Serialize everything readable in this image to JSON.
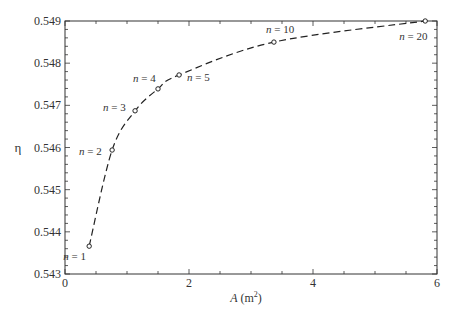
{
  "chart_data": {
    "type": "line",
    "title": "",
    "xlabel": "A (m²)",
    "xlabel_parts": {
      "var": "A",
      "unit_open": " (m",
      "sup": "2",
      "unit_close": ")"
    },
    "ylabel": "η",
    "xlim": [
      0,
      6
    ],
    "ylim": [
      0.543,
      0.549
    ],
    "xticks": [
      0,
      2,
      4,
      6
    ],
    "xtick_labels": [
      "0",
      "2",
      "4",
      "6"
    ],
    "x_minor_step": 0.5,
    "yticks": [
      0.543,
      0.544,
      0.545,
      0.546,
      0.547,
      0.548,
      0.549
    ],
    "ytick_labels": [
      "0.543",
      "0.544",
      "0.545",
      "0.546",
      "0.547",
      "0.548",
      "0.549"
    ],
    "y_minor_step": 0.0002,
    "grid": false,
    "line_style": "dashed",
    "marker": "open-circle",
    "series": [
      {
        "name": "η vs A",
        "points": [
          {
            "label": "n = 1",
            "x": 0.39,
            "y": 0.54366
          },
          {
            "label": "n = 2",
            "x": 0.76,
            "y": 0.54594
          },
          {
            "label": "n = 3",
            "x": 1.13,
            "y": 0.54687
          },
          {
            "label": "n = 4",
            "x": 1.5,
            "y": 0.54739
          },
          {
            "label": "n = 5",
            "x": 1.84,
            "y": 0.54772
          },
          {
            "label": "n = 10",
            "x": 3.37,
            "y": 0.5485
          },
          {
            "label": "n = 20",
            "x": 5.81,
            "y": 0.549
          }
        ]
      }
    ],
    "annotations": [
      {
        "text": "n = 1",
        "anchor_point": 0,
        "dx": -26,
        "dy": 14
      },
      {
        "text": "n = 2",
        "anchor_point": 1,
        "dx": -33,
        "dy": 5
      },
      {
        "text": "n = 3",
        "anchor_point": 2,
        "dx": -32,
        "dy": 0
      },
      {
        "text": "n = 4",
        "anchor_point": 3,
        "dx": -25,
        "dy": -7
      },
      {
        "text": "n = 5",
        "anchor_point": 4,
        "dx": 8,
        "dy": 6
      },
      {
        "text": "n = 10",
        "anchor_point": 5,
        "dx": -8,
        "dy": -9
      },
      {
        "text": "n = 20",
        "anchor_point": 6,
        "dx": -26,
        "dy": 19
      }
    ]
  }
}
